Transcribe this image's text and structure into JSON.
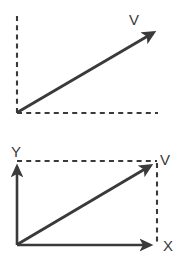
{
  "figure": {
    "stroke_color": "#3a3a3a",
    "background_color": "#ffffff",
    "panels": [
      {
        "name": "free-vector-panel",
        "labels": {
          "vector": "V"
        },
        "elements": {
          "vertical_dashed_guide": "dashed",
          "horizontal_dashed_guide": "dashed",
          "vector_arrow": "solid-arrow"
        },
        "geometry": {
          "origin": [
            17,
            113
          ],
          "tip": [
            158,
            30
          ],
          "vertical_guide_top": 16,
          "horizontal_guide_right": 158
        }
      },
      {
        "name": "resolved-vector-panel",
        "labels": {
          "y_axis": "Y",
          "x_axis": "X",
          "vector": "V"
        },
        "elements": {
          "y_axis": "solid-arrow",
          "x_axis": "solid-arrow",
          "vector_arrow": "solid-arrow",
          "horizontal_dashed_projection": "dashed",
          "vertical_dashed_projection": "dashed"
        },
        "geometry": {
          "origin": [
            17,
            245
          ],
          "tip": [
            155,
            163
          ],
          "y_axis_top": 163,
          "x_axis_right": 155,
          "projection_x": 157,
          "projection_y": 161
        }
      }
    ]
  }
}
